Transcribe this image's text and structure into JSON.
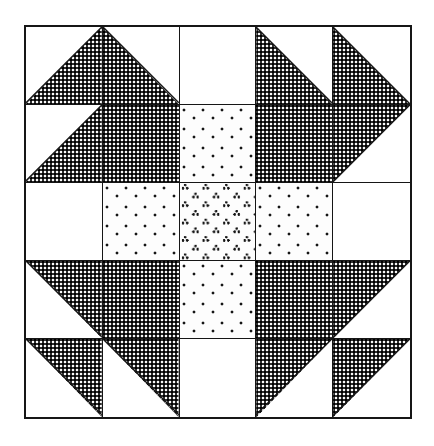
{
  "figure": {
    "background_color": "#ffffff",
    "line_color": "#161616",
    "block": {
      "grid_rows": 5,
      "grid_cols": 5,
      "border_width_px": 2,
      "seam_width_px": 1.5
    }
  },
  "fabrics": [
    {
      "key": "dark",
      "label": "Dark print",
      "color": "#2e2e2e"
    },
    {
      "key": "dots",
      "label": "Light dotted print",
      "color": "#fdfdfd"
    },
    {
      "key": "clover",
      "label": "Light clover print",
      "color": "#fdfdfd"
    },
    {
      "key": "plain",
      "label": "Plain light",
      "color": "#ffffff"
    }
  ],
  "patches": [
    {
      "row": 0,
      "col": 0,
      "shape": "half-square-triangle",
      "orientation": "bottom-right",
      "fabric": "dark",
      "name": "patch-r0c0"
    },
    {
      "row": 0,
      "col": 1,
      "shape": "half-square-triangle",
      "orientation": "bottom-left",
      "fabric": "dark",
      "name": "patch-r0c1"
    },
    {
      "row": 0,
      "col": 2,
      "shape": "square",
      "orientation": "none",
      "fabric": "plain",
      "name": "patch-r0c2"
    },
    {
      "row": 0,
      "col": 3,
      "shape": "half-square-triangle",
      "orientation": "bottom-left",
      "fabric": "dark",
      "name": "patch-r0c3"
    },
    {
      "row": 0,
      "col": 4,
      "shape": "half-square-triangle",
      "orientation": "bottom-left",
      "fabric": "dark",
      "name": "patch-r0c4"
    },
    {
      "row": 1,
      "col": 0,
      "shape": "half-square-triangle",
      "orientation": "bottom-right",
      "fabric": "dark",
      "name": "patch-r1c0"
    },
    {
      "row": 1,
      "col": 1,
      "shape": "square",
      "orientation": "none",
      "fabric": "dark",
      "name": "patch-r1c1"
    },
    {
      "row": 1,
      "col": 2,
      "shape": "square",
      "orientation": "none",
      "fabric": "dots",
      "name": "patch-r1c2"
    },
    {
      "row": 1,
      "col": 3,
      "shape": "square",
      "orientation": "none",
      "fabric": "dark",
      "name": "patch-r1c3"
    },
    {
      "row": 1,
      "col": 4,
      "shape": "half-square-triangle",
      "orientation": "top-left",
      "fabric": "dark",
      "name": "patch-r1c4"
    },
    {
      "row": 2,
      "col": 0,
      "shape": "square",
      "orientation": "none",
      "fabric": "plain",
      "name": "patch-r2c0"
    },
    {
      "row": 2,
      "col": 1,
      "shape": "square",
      "orientation": "none",
      "fabric": "dots",
      "name": "patch-r2c1"
    },
    {
      "row": 2,
      "col": 2,
      "shape": "square",
      "orientation": "none",
      "fabric": "clover",
      "name": "patch-r2c2"
    },
    {
      "row": 2,
      "col": 3,
      "shape": "square",
      "orientation": "none",
      "fabric": "dots",
      "name": "patch-r2c3"
    },
    {
      "row": 2,
      "col": 4,
      "shape": "square",
      "orientation": "none",
      "fabric": "plain",
      "name": "patch-r2c4"
    },
    {
      "row": 3,
      "col": 0,
      "shape": "half-square-triangle",
      "orientation": "top-right",
      "fabric": "dark",
      "name": "patch-r3c0"
    },
    {
      "row": 3,
      "col": 1,
      "shape": "square",
      "orientation": "none",
      "fabric": "dark",
      "name": "patch-r3c1"
    },
    {
      "row": 3,
      "col": 2,
      "shape": "square",
      "orientation": "none",
      "fabric": "dots",
      "name": "patch-r3c2"
    },
    {
      "row": 3,
      "col": 3,
      "shape": "square",
      "orientation": "none",
      "fabric": "dark",
      "name": "patch-r3c3"
    },
    {
      "row": 3,
      "col": 4,
      "shape": "half-square-triangle",
      "orientation": "top-left",
      "fabric": "dark",
      "name": "patch-r3c4"
    },
    {
      "row": 4,
      "col": 0,
      "shape": "half-square-triangle",
      "orientation": "top-right",
      "fabric": "dark",
      "name": "patch-r4c0"
    },
    {
      "row": 4,
      "col": 1,
      "shape": "half-square-triangle",
      "orientation": "top-right",
      "fabric": "dark",
      "name": "patch-r4c1"
    },
    {
      "row": 4,
      "col": 2,
      "shape": "square",
      "orientation": "none",
      "fabric": "plain",
      "name": "patch-r4c2"
    },
    {
      "row": 4,
      "col": 3,
      "shape": "half-square-triangle",
      "orientation": "top-left",
      "fabric": "dark",
      "name": "patch-r4c3"
    },
    {
      "row": 4,
      "col": 4,
      "shape": "half-square-triangle",
      "orientation": "top-left",
      "fabric": "dark",
      "name": "patch-r4c4"
    }
  ]
}
